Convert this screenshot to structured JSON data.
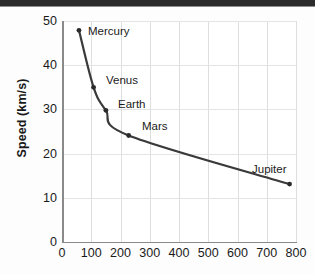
{
  "chart_data": {
    "type": "line",
    "title": "",
    "subtitle": "",
    "xlabel": "",
    "ylabel": "Speed (km/s)",
    "xlim": [
      0,
      800
    ],
    "ylim": [
      0,
      50
    ],
    "grid": true,
    "legend_position": "none",
    "xticks": [
      "0",
      "100",
      "200",
      "300",
      "400",
      "500",
      "600",
      "700",
      "800"
    ],
    "xtick_values": [
      0,
      100,
      200,
      300,
      400,
      500,
      600,
      700,
      800
    ],
    "yticks": [
      "0",
      "10",
      "20",
      "30",
      "40",
      "50"
    ],
    "ytick_values": [
      0,
      10,
      20,
      30,
      40,
      50
    ],
    "series": [
      {
        "name": "Orbital speed",
        "marker": "filled-circle",
        "line_color": "#3a3a3a",
        "points": [
          {
            "label": "Mercury",
            "x": 58,
            "y": 47.9
          },
          {
            "label": "Venus",
            "x": 108,
            "y": 35.0
          },
          {
            "label": "Earth",
            "x": 150,
            "y": 29.8
          },
          {
            "label": "Mars",
            "x": 228,
            "y": 24.1
          },
          {
            "label": "Jupiter",
            "x": 778,
            "y": 13.1
          }
        ]
      }
    ],
    "annotations": [
      {
        "text": "Mercury",
        "x": 58,
        "y": 47.9
      },
      {
        "text": "Venus",
        "x": 108,
        "y": 35.0
      },
      {
        "text": "Earth",
        "x": 150,
        "y": 29.8
      },
      {
        "text": "Mars",
        "x": 228,
        "y": 24.1
      },
      {
        "text": "Jupiter",
        "x": 778,
        "y": 13.1
      }
    ]
  },
  "colors": {
    "line": "#3a3a3a",
    "marker": "#2b2b2b",
    "grid": "#dedede",
    "axis": "#8a8a8a",
    "text": "#1a1a1a",
    "top_band": "#2b2b2b",
    "plot_background": "#ffffff",
    "page_background": "#fdfdfd"
  },
  "annotation_positions": [
    {
      "name": "Mercury",
      "left": 88,
      "top": 19
    },
    {
      "name": "Venus",
      "left": 106,
      "top": 68
    },
    {
      "name": "Earth",
      "left": 118,
      "top": 92
    },
    {
      "name": "Mars",
      "left": 142,
      "top": 114
    },
    {
      "name": "Jupiter",
      "left": 252,
      "top": 157
    }
  ]
}
